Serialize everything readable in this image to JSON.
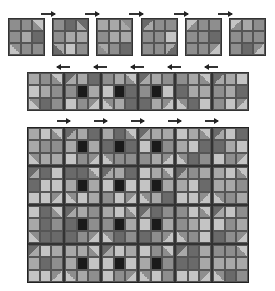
{
  "diagram": {
    "palette": {
      "light": "#c4c4c4",
      "lightmid": "#a8a8a8",
      "mid": "#8e8e8e",
      "dark": "#6a6a6a",
      "black": "#1a1a1a"
    },
    "top_blocks": {
      "count": 6,
      "arrow_direction": "right",
      "blocks": [
        [
          "mid",
          "mid",
          "tri-light-tr",
          "mid",
          "lightmid",
          "dark",
          "tri-light-bl",
          "mid",
          "mid"
        ],
        [
          "mid",
          "dark",
          "tri-dark-tr",
          "mid",
          "lightmid",
          "lightmid",
          "tri-dark-bl",
          "light",
          "mid"
        ],
        [
          "lightmid",
          "lightmid",
          "tri-mid-tr",
          "mid",
          "lightmid",
          "lightmid",
          "tri-mid-bl",
          "mid",
          "dark"
        ],
        [
          "tri-dark-tl",
          "mid",
          "mid",
          "mid",
          "mid",
          "light",
          "mid",
          "mid",
          "tri-dark-br"
        ],
        [
          "tri-light-tl",
          "mid",
          "mid",
          "mid",
          "mid",
          "dark",
          "mid",
          "mid",
          "tri-light-br"
        ],
        [
          "tri-light-tl",
          "lightmid",
          "mid",
          "mid",
          "mid",
          "mid",
          "mid",
          "dark",
          "tri-light-br"
        ]
      ]
    },
    "row_strip": {
      "blocks": 6,
      "arrow_direction": "left"
    },
    "quilt_top": {
      "columns": 6,
      "rows": 4,
      "arrow_direction_top": "right"
    }
  }
}
